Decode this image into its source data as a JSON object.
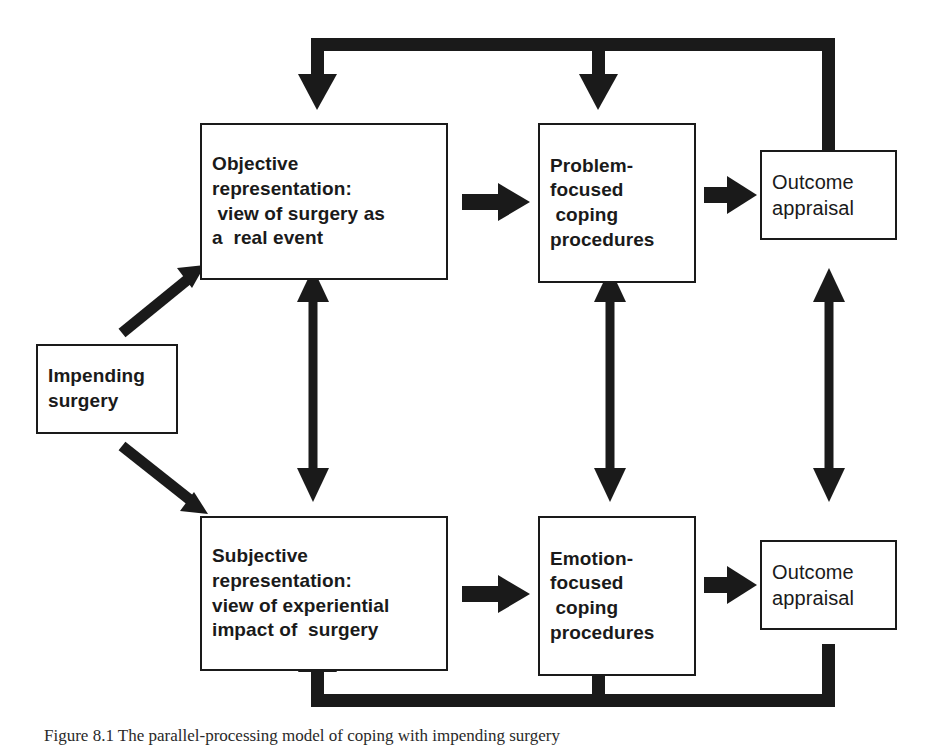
{
  "figure": {
    "caption": "Figure 8.1   The parallel-processing model of coping with impending surgery",
    "ink_color": "#1a1a1a",
    "background_color": "#ffffff"
  },
  "nodes": {
    "impending": {
      "id": "impending-surgery",
      "lines": [
        "Impending",
        "surgery"
      ]
    },
    "objective": {
      "id": "objective-representation",
      "lines": [
        "Objective",
        "representation:",
        " view of surgery as",
        "a  real event"
      ]
    },
    "problem_focused": {
      "id": "problem-focused-coping",
      "lines": [
        "Problem-",
        "focused",
        " coping",
        "procedures"
      ]
    },
    "outcome_top": {
      "id": "outcome-appraisal-top",
      "lines": [
        "Outcome",
        "appraisal"
      ]
    },
    "subjective": {
      "id": "subjective-representation",
      "lines": [
        "Subjective",
        "representation:",
        "view of experiential",
        "impact of  surgery"
      ]
    },
    "emotion_focused": {
      "id": "emotion-focused-coping",
      "lines": [
        "Emotion-",
        "focused",
        " coping",
        "procedures"
      ]
    },
    "outcome_bottom": {
      "id": "outcome-appraisal-bottom",
      "lines": [
        "Outcome",
        "appraisal"
      ]
    }
  },
  "connectors": [
    {
      "name": "impending-to-objective",
      "type": "diagonal-arrow",
      "direction": "up-right"
    },
    {
      "name": "impending-to-subjective",
      "type": "diagonal-arrow",
      "direction": "down-right"
    },
    {
      "name": "objective-to-problem-focused",
      "type": "arrow",
      "direction": "right"
    },
    {
      "name": "problem-focused-to-outcome-top",
      "type": "arrow",
      "direction": "right"
    },
    {
      "name": "subjective-to-emotion-focused",
      "type": "arrow",
      "direction": "right"
    },
    {
      "name": "emotion-focused-to-outcome-bottom",
      "type": "arrow",
      "direction": "right"
    },
    {
      "name": "representation-link",
      "type": "double-arrow",
      "direction": "vertical"
    },
    {
      "name": "coping-link",
      "type": "double-arrow",
      "direction": "vertical"
    },
    {
      "name": "outcome-link",
      "type": "double-arrow",
      "direction": "vertical"
    },
    {
      "name": "top-feedback-loop",
      "type": "feedback-loop",
      "direction": "right-to-left"
    },
    {
      "name": "bottom-feedback-loop",
      "type": "feedback-loop",
      "direction": "right-to-left"
    }
  ]
}
